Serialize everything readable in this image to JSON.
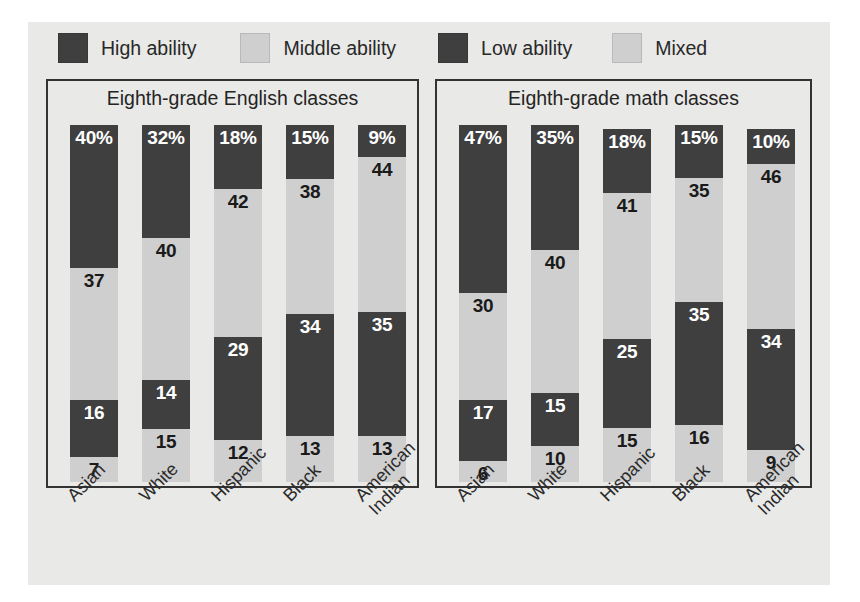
{
  "legend": {
    "items": [
      {
        "label": "High ability",
        "color": "#3f3f3f",
        "icon": "legend-swatch-high"
      },
      {
        "label": "Middle ability",
        "color": "#cfcfcf",
        "icon": "legend-swatch-middle"
      },
      {
        "label": "Low ability",
        "color": "#3f3f3f",
        "icon": "legend-swatch-low"
      },
      {
        "label": "Mixed",
        "color": "#cfcfcf",
        "icon": "legend-swatch-mixed"
      }
    ]
  },
  "panels": [
    {
      "title": "Eighth-grade English classes"
    },
    {
      "title": "Eighth-grade math classes"
    }
  ],
  "categories": [
    "Asian",
    "White",
    "Hispanic",
    "Black",
    "American\nIndian"
  ],
  "chart_data": [
    {
      "type": "bar",
      "title": "Eighth-grade English classes",
      "subtitle": "",
      "xlabel": "",
      "ylabel": "",
      "stacked": true,
      "grid": false,
      "legend_position": "top",
      "ylim": [
        0,
        100
      ],
      "categories": [
        "Asian",
        "White",
        "Hispanic",
        "Black",
        "American Indian"
      ],
      "series": [
        {
          "name": "High ability",
          "color": "#3f3f3f",
          "values": [
            40,
            32,
            18,
            15,
            9
          ],
          "labels": [
            "40%",
            "32%",
            "18%",
            "15%",
            "9%"
          ]
        },
        {
          "name": "Middle ability",
          "color": "#cfcfcf",
          "values": [
            37,
            40,
            42,
            38,
            44
          ],
          "labels": [
            "37",
            "40",
            "42",
            "38",
            "44"
          ]
        },
        {
          "name": "Low ability",
          "color": "#3f3f3f",
          "values": [
            16,
            14,
            29,
            34,
            35
          ],
          "labels": [
            "16",
            "14",
            "29",
            "34",
            "35"
          ]
        },
        {
          "name": "Mixed",
          "color": "#cfcfcf",
          "values": [
            7,
            15,
            12,
            13,
            13
          ],
          "labels": [
            "7",
            "15",
            "12",
            "13",
            "13"
          ]
        }
      ]
    },
    {
      "type": "bar",
      "title": "Eighth-grade math classes",
      "subtitle": "",
      "xlabel": "",
      "ylabel": "",
      "stacked": true,
      "grid": false,
      "legend_position": "top",
      "ylim": [
        0,
        100
      ],
      "categories": [
        "Asian",
        "White",
        "Hispanic",
        "Black",
        "American Indian"
      ],
      "series": [
        {
          "name": "High ability",
          "color": "#3f3f3f",
          "values": [
            47,
            35,
            18,
            15,
            10
          ],
          "labels": [
            "47%",
            "35%",
            "18%",
            "15%",
            "10%"
          ]
        },
        {
          "name": "Middle ability",
          "color": "#cfcfcf",
          "values": [
            30,
            40,
            41,
            35,
            46
          ],
          "labels": [
            "30",
            "40",
            "41",
            "35",
            "46"
          ]
        },
        {
          "name": "Low ability",
          "color": "#3f3f3f",
          "values": [
            17,
            15,
            25,
            35,
            34
          ],
          "labels": [
            "17",
            "15",
            "25",
            "35",
            "34"
          ]
        },
        {
          "name": "Mixed",
          "color": "#cfcfcf",
          "values": [
            6,
            10,
            15,
            16,
            9
          ],
          "labels": [
            "6",
            "10",
            "15",
            "16",
            "9"
          ]
        }
      ]
    }
  ]
}
